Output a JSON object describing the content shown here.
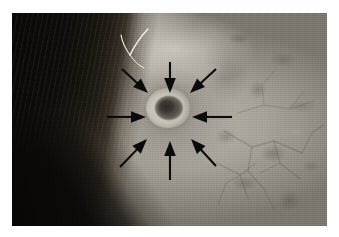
{
  "figure": {
    "kind": "clinical-photograph",
    "caption": "",
    "border": {
      "page_background": "#ffffff",
      "photo_left": 12,
      "photo_top": 13,
      "photo_width": 315,
      "photo_height": 213
    }
  },
  "photo": {
    "alt_text": "Close-up photograph of an ear showing a small crusted lesion in the conchal bowl, indicated by eight converging black arrows",
    "regions": [
      {
        "name": "hair",
        "label": "dark hair",
        "position": "left edge",
        "color": "#0f0d0b"
      },
      {
        "name": "helix",
        "label": "helix ridge",
        "position": "upper-left to lower-centre",
        "color": "#e8e4db"
      },
      {
        "name": "antihelix",
        "label": "antihelix fold",
        "position": "upper centre",
        "color": "#c8c3ba"
      },
      {
        "name": "concha",
        "label": "conchal bowl",
        "position": "centre",
        "color": "#a09b92"
      },
      {
        "name": "peri-auricular-skin",
        "label": "mottled peri-auricular skin",
        "position": "right field",
        "color": "#a5a098"
      },
      {
        "name": "shadow",
        "label": "shadow below lobule",
        "position": "lower-left",
        "color": "#100e0c"
      },
      {
        "name": "vessels",
        "label": "branching creases and telangiectasia",
        "position": "lower-right",
        "color": "#5d584f"
      },
      {
        "name": "stray-hair",
        "label": "single white hair",
        "position": "upper centre",
        "color": "#f2efe6"
      }
    ],
    "lesion": {
      "label": "central crusted lesion",
      "center_x": 168,
      "center_y": 108,
      "diameter_px": 44,
      "rim_color": "#e2ded4",
      "crust_color": "#2e2c28"
    }
  },
  "annotations": {
    "marker_type": "arrow",
    "marker_color": "#0b0b0b",
    "count": 8,
    "target_label": "lesion margin",
    "arrows": [
      {
        "name": "arrow-n",
        "label": "arrow from top",
        "angle_deg": 270,
        "x1": 170,
        "y1": 62,
        "x2": 170,
        "y2": 93
      },
      {
        "name": "arrow-ne",
        "label": "arrow from upper-right",
        "angle_deg": 225,
        "x1": 216,
        "y1": 69,
        "x2": 190,
        "y2": 93
      },
      {
        "name": "arrow-e",
        "label": "arrow from right",
        "angle_deg": 180,
        "x1": 232,
        "y1": 117,
        "x2": 192,
        "y2": 117
      },
      {
        "name": "arrow-se",
        "label": "arrow from lower-right",
        "angle_deg": 135,
        "x1": 216,
        "y1": 166,
        "x2": 191,
        "y2": 139
      },
      {
        "name": "arrow-s",
        "label": "arrow from bottom",
        "angle_deg": 90,
        "x1": 170,
        "y1": 180,
        "x2": 170,
        "y2": 141
      },
      {
        "name": "arrow-sw",
        "label": "arrow from lower-left",
        "angle_deg": 45,
        "x1": 120,
        "y1": 167,
        "x2": 147,
        "y2": 139
      },
      {
        "name": "arrow-w",
        "label": "arrow from left",
        "angle_deg": 0,
        "x1": 107,
        "y1": 117,
        "x2": 146,
        "y2": 117
      },
      {
        "name": "arrow-nw",
        "label": "arrow from upper-left",
        "angle_deg": 315,
        "x1": 122,
        "y1": 69,
        "x2": 148,
        "y2": 93
      }
    ]
  }
}
